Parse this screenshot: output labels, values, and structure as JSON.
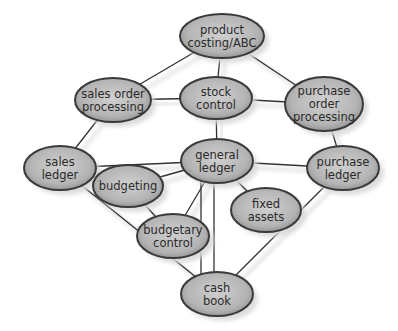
{
  "diagram": {
    "title": "",
    "colors": {
      "node_fill_center": "#c8c8c8",
      "node_fill_edge": "#9a9a9a",
      "node_stroke": "#3a3a3a",
      "edge": "#333333",
      "shadow": "#d8d8d8"
    },
    "nodes": [
      {
        "id": "product_costing",
        "lines": [
          "product",
          "costing/ABC"
        ],
        "cx": 222,
        "cy": 36,
        "rx": 42,
        "ry": 22
      },
      {
        "id": "sales_order",
        "lines": [
          "sales order",
          "processing"
        ],
        "cx": 113,
        "cy": 100,
        "rx": 38,
        "ry": 22
      },
      {
        "id": "stock_control",
        "lines": [
          "stock",
          "control"
        ],
        "cx": 216,
        "cy": 98,
        "rx": 36,
        "ry": 21
      },
      {
        "id": "purchase_order",
        "lines": [
          "purchase",
          "order",
          "processing"
        ],
        "cx": 324,
        "cy": 104,
        "rx": 39,
        "ry": 27
      },
      {
        "id": "sales_ledger",
        "lines": [
          "sales",
          "ledger"
        ],
        "cx": 60,
        "cy": 168,
        "rx": 36,
        "ry": 22
      },
      {
        "id": "general_ledger",
        "lines": [
          "general",
          "ledger"
        ],
        "cx": 217,
        "cy": 161,
        "rx": 36,
        "ry": 22
      },
      {
        "id": "purchase_ledger",
        "lines": [
          "purchase",
          "ledger"
        ],
        "cx": 343,
        "cy": 168,
        "rx": 36,
        "ry": 22
      },
      {
        "id": "budgeting",
        "lines": [
          "budgeting"
        ],
        "cx": 128,
        "cy": 186,
        "rx": 35,
        "ry": 21
      },
      {
        "id": "fixed_assets",
        "lines": [
          "fixed",
          "assets"
        ],
        "cx": 266,
        "cy": 210,
        "rx": 35,
        "ry": 22
      },
      {
        "id": "budgetary_control",
        "lines": [
          "budgetary",
          "control"
        ],
        "cx": 173,
        "cy": 236,
        "rx": 36,
        "ry": 22
      },
      {
        "id": "cash_book",
        "lines": [
          "cash",
          "book"
        ],
        "cx": 217,
        "cy": 294,
        "rx": 36,
        "ry": 22
      }
    ],
    "edges": [
      [
        "product_costing",
        "sales_order"
      ],
      [
        "product_costing",
        "stock_control"
      ],
      [
        "product_costing",
        "purchase_order"
      ],
      [
        "sales_order",
        "stock_control"
      ],
      [
        "stock_control",
        "purchase_order"
      ],
      [
        "stock_control",
        "general_ledger"
      ],
      [
        "sales_order",
        "sales_ledger"
      ],
      [
        "purchase_order",
        "purchase_ledger"
      ],
      [
        "sales_ledger",
        "general_ledger"
      ],
      [
        "general_ledger",
        "purchase_ledger"
      ],
      [
        "general_ledger",
        "budgeting"
      ],
      [
        "general_ledger",
        "fixed_assets"
      ],
      [
        "general_ledger",
        "budgetary_control"
      ],
      [
        "budgeting",
        "budgetary_control"
      ],
      [
        "sales_ledger",
        "cash_book"
      ],
      [
        "purchase_ledger",
        "cash_book"
      ]
    ],
    "vertical_links": [
      {
        "from": "general_ledger",
        "to": "cash_book",
        "x": 214
      },
      {
        "from": "general_ledger",
        "to": "cash_book",
        "x": 201
      }
    ]
  }
}
